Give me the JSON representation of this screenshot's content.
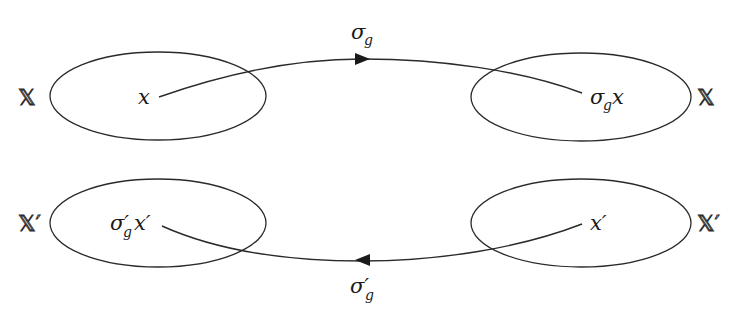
{
  "diagram": {
    "type": "commutative-mapping-diagram",
    "top_row": {
      "left_set": {
        "label": "𝕏",
        "element": "x"
      },
      "right_set": {
        "label": "𝕏",
        "element": "σ",
        "element_sub": "g",
        "element_suffix": "x"
      },
      "map": {
        "symbol": "σ",
        "sub": "g",
        "direction": "left-to-right"
      }
    },
    "bottom_row": {
      "left_set": {
        "label": "𝕏′",
        "element": "σ′",
        "element_sub": "g",
        "element_suffix": "x′"
      },
      "right_set": {
        "label": "𝕏′",
        "element": "x′"
      },
      "map": {
        "symbol": "σ′",
        "sub": "g",
        "direction": "right-to-left"
      }
    },
    "colors": {
      "stroke": "#2a2a2a",
      "background": "#ffffff"
    }
  }
}
